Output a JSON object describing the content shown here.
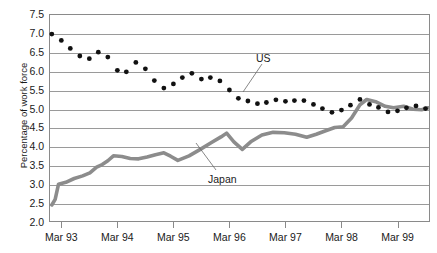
{
  "chart_data": {
    "type": "scatter",
    "title": "",
    "xlabel": "",
    "ylabel": "Percentage of work force",
    "ylim": [
      2.0,
      7.5
    ],
    "ytick_labels": [
      "7.5",
      "7.0",
      "6.5",
      "6.0",
      "5.5",
      "5.0",
      "4.5",
      "4.0",
      "3.5",
      "3.0",
      "2.5",
      "2.0"
    ],
    "ytick_values": [
      7.5,
      7.0,
      6.5,
      6.0,
      5.5,
      5.0,
      4.5,
      4.0,
      3.5,
      3.0,
      2.5,
      2.0
    ],
    "xtick_labels": [
      "Mar 93",
      "Mar 94",
      "Mar 95",
      "Mar 96",
      "Mar 97",
      "Mar 98",
      "Mar 99"
    ],
    "xtick_values": [
      1993.17,
      1994.17,
      1995.17,
      1996.17,
      1997.17,
      1998.17,
      1999.17
    ],
    "xlim": [
      1992.95,
      1999.75
    ],
    "grid": true,
    "legend_position": "inline-annotation",
    "series": [
      {
        "name": "US",
        "style": "dots",
        "color": "#111111",
        "x": [
          1993.0,
          1993.17,
          1993.33,
          1993.5,
          1993.67,
          1993.83,
          1994.0,
          1994.17,
          1994.33,
          1994.5,
          1994.67,
          1994.83,
          1995.0,
          1995.17,
          1995.33,
          1995.5,
          1995.67,
          1995.83,
          1996.0,
          1996.17,
          1996.33,
          1996.5,
          1996.67,
          1996.83,
          1997.0,
          1997.17,
          1997.33,
          1997.5,
          1997.67,
          1997.83,
          1998.0,
          1998.17,
          1998.33,
          1998.5,
          1998.67,
          1998.83,
          1999.0,
          1999.17,
          1999.33,
          1999.5,
          1999.67
        ],
        "y": [
          6.97,
          6.8,
          6.59,
          6.39,
          6.32,
          6.49,
          6.36,
          6.01,
          5.97,
          6.22,
          6.05,
          5.74,
          5.54,
          5.65,
          5.82,
          5.93,
          5.78,
          5.82,
          5.73,
          5.49,
          5.27,
          5.2,
          5.13,
          5.16,
          5.23,
          5.19,
          5.21,
          5.21,
          5.11,
          5.0,
          4.9,
          4.96,
          5.09,
          5.24,
          5.11,
          5.03,
          4.91,
          4.94,
          5.02,
          5.07,
          5.0
        ]
      },
      {
        "name": "Japan",
        "style": "thick-line",
        "color": "#8c8c8c",
        "x": [
          1993.0,
          1993.06,
          1993.12,
          1993.25,
          1993.4,
          1993.55,
          1993.68,
          1993.8,
          1993.9,
          1994.0,
          1994.1,
          1994.25,
          1994.4,
          1994.55,
          1994.7,
          1994.85,
          1995.0,
          1995.12,
          1995.25,
          1995.45,
          1995.65,
          1995.85,
          1996.02,
          1996.12,
          1996.25,
          1996.4,
          1996.55,
          1996.75,
          1996.95,
          1997.15,
          1997.35,
          1997.55,
          1997.72,
          1997.9,
          1998.05,
          1998.2,
          1998.35,
          1998.5,
          1998.62,
          1998.78,
          1998.95,
          1999.1,
          1999.28,
          1999.45,
          1999.6,
          1999.72
        ],
        "y": [
          2.45,
          2.6,
          3.0,
          3.05,
          3.15,
          3.22,
          3.3,
          3.45,
          3.52,
          3.62,
          3.75,
          3.73,
          3.68,
          3.67,
          3.72,
          3.78,
          3.83,
          3.74,
          3.63,
          3.75,
          3.92,
          4.1,
          4.25,
          4.35,
          4.12,
          3.92,
          4.12,
          4.3,
          4.37,
          4.36,
          4.32,
          4.24,
          4.32,
          4.42,
          4.5,
          4.52,
          4.75,
          5.1,
          5.24,
          5.18,
          5.06,
          5.02,
          5.06,
          4.98,
          4.97,
          5.02
        ]
      }
    ],
    "annotations": [
      {
        "name": "us-annot",
        "text": "US",
        "leader": true
      },
      {
        "name": "japan-annot",
        "text": "Japan",
        "leader": true
      }
    ]
  }
}
